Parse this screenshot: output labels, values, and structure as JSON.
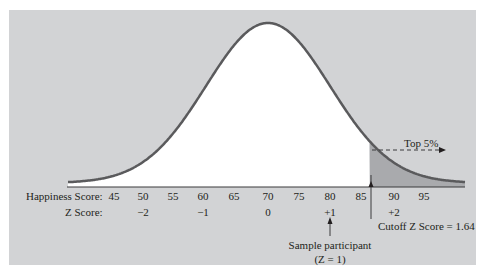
{
  "chart_data": {
    "type": "area",
    "title": "",
    "distribution": {
      "mean": 70,
      "sd": 10
    },
    "xlabel_rows": [
      {
        "label": "Happiness Score:",
        "ticks": [
          "45",
          "50",
          "55",
          "60",
          "65",
          "70",
          "75",
          "80",
          "85",
          "90",
          "95"
        ],
        "values": [
          45,
          50,
          55,
          60,
          65,
          70,
          75,
          80,
          85,
          90,
          95
        ]
      },
      {
        "label": "Z Score:",
        "ticks": [
          "−2",
          "−1",
          "0",
          "+1",
          "+2"
        ],
        "values": [
          50,
          60,
          70,
          80,
          90
        ]
      }
    ],
    "xlim": [
      43,
      100
    ],
    "shaded_region": {
      "from_z": 1.64,
      "to_z": "inf",
      "label": "Top 5%"
    },
    "annotations": [
      {
        "text": "Top 5%",
        "type": "dashed-arrow-right"
      },
      {
        "text": "Cutoff Z Score = 1.64",
        "x_z": 1.64
      },
      {
        "text": "Sample participant",
        "subtext": "(Z = 1)",
        "x_z": 1
      }
    ],
    "grid": false,
    "legend": null,
    "colors": {
      "panel": "#d2d3d5",
      "curve_fill": "#ffffff",
      "curve_line": "#5a5a5c",
      "tail_fill": "#a9aaad",
      "axis": "#3a3a3c"
    }
  },
  "labels": {
    "happiness_row": "Happiness Score:",
    "z_row": "Z Score:",
    "happiness_ticks": [
      "45",
      "50",
      "55",
      "60",
      "65",
      "70",
      "75",
      "80",
      "85",
      "90",
      "95"
    ],
    "z_ticks": [
      "−2",
      "−1",
      "0",
      "+1",
      "+2"
    ],
    "top5": "Top 5%",
    "cutoff": "Cutoff Z Score = 1.64",
    "sample": "Sample participant",
    "sample_z": "(Z = 1)"
  }
}
